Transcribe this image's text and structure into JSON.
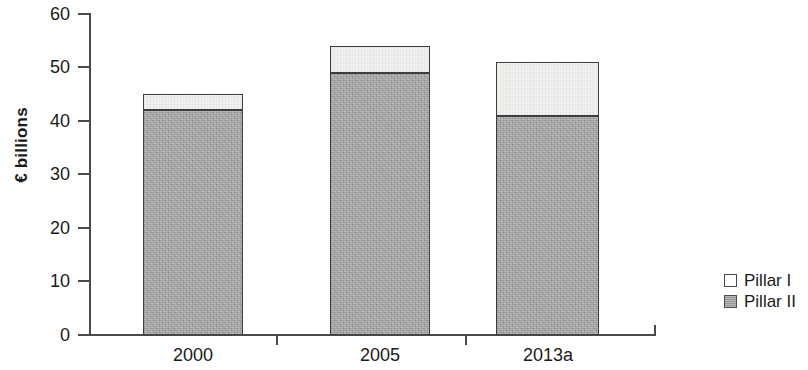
{
  "chart_data": {
    "type": "bar",
    "stacked": true,
    "title": "",
    "xlabel": "",
    "ylabel": "€ billions",
    "categories": [
      "2000",
      "2005",
      "2013a"
    ],
    "series": [
      {
        "name": "Pillar I",
        "values": [
          3,
          5,
          10
        ],
        "color": "#f3f3f2"
      },
      {
        "name": "Pillar II",
        "values": [
          42,
          49,
          41
        ],
        "color": "#a6a6a6"
      }
    ],
    "totals": [
      45,
      54,
      51
    ],
    "ylim": [
      0,
      60
    ],
    "yticks": [
      0,
      10,
      20,
      30,
      40,
      50,
      60
    ],
    "ytick_labels": [
      "0",
      "10",
      "20",
      "30",
      "40",
      "50",
      "60"
    ],
    "grid": false,
    "legend_position": "right"
  },
  "legend": {
    "entries": [
      {
        "label": "Pillar I",
        "swatch": "pillar1"
      },
      {
        "label": "Pillar II",
        "swatch": "pillar2"
      }
    ]
  },
  "axis": {
    "y_label": "€ billions",
    "tick_0": "0",
    "tick_10": "10",
    "tick_20": "20",
    "tick_30": "30",
    "tick_40": "40",
    "tick_50": "50",
    "tick_60": "60"
  },
  "xlabels": {
    "cat_0": "2000",
    "cat_1": "2005",
    "cat_2": "2013a"
  }
}
